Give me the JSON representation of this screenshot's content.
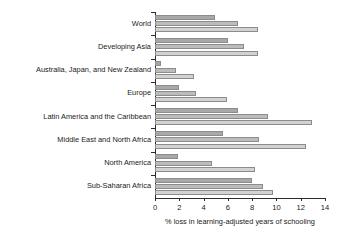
{
  "chart_data": {
    "type": "bar",
    "orientation": "horizontal",
    "title": "",
    "subtitle": "",
    "xlabel": "% loss in learning-adjusted years of schooling",
    "ylabel": "",
    "xlim": [
      0,
      14
    ],
    "xticks": [
      0,
      2,
      4,
      6,
      8,
      10,
      12,
      14
    ],
    "xticklabels": [
      "0",
      "2",
      "4",
      "6",
      "8",
      "10",
      "12",
      "14"
    ],
    "grid": false,
    "legend": "none",
    "categories": [
      "World",
      "Developing Asia",
      "Australia, Japan, and New Zealand",
      "Europe",
      "Latin America and the Caribbean",
      "Middle East and North Africa",
      "North America",
      "Sub-Saharan Africa"
    ],
    "series": [
      {
        "name": "series-1",
        "color": "#a8a8a8",
        "values": [
          4.9,
          6.0,
          0.5,
          2.0,
          6.8,
          5.6,
          1.9,
          8.0
        ]
      },
      {
        "name": "series-2",
        "color": "#bcbcbc",
        "values": [
          6.8,
          7.3,
          1.7,
          3.4,
          9.3,
          8.6,
          4.7,
          8.9
        ]
      },
      {
        "name": "series-3",
        "color": "#d2d2d2",
        "values": [
          8.5,
          8.5,
          3.2,
          5.9,
          12.9,
          12.4,
          8.2,
          9.7
        ]
      }
    ]
  },
  "axis": {
    "x_title": "% loss in learning-adjusted years of schooling"
  }
}
